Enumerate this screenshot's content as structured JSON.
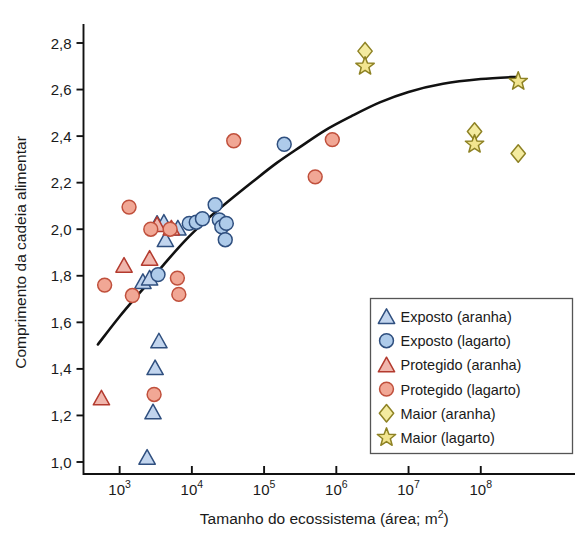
{
  "chart_data": {
    "type": "scatter",
    "title": "",
    "xlabel": "Tamanho do ecossistema (área; m2)",
    "xlabel_base": "Tamanho do ecossistema (área; m",
    "xlabel_sup": "2",
    "xlabel_tail": ")",
    "ylabel": "Comprimento da cadeia alimentar",
    "xscale": "log",
    "xlim": [
      316,
      1000000000
    ],
    "ylim": [
      0.93,
      2.92
    ],
    "grid": false,
    "legend_position": "bottom-right",
    "xticks": [
      {
        "value": 1000,
        "mantissa": "10",
        "exponent": "3"
      },
      {
        "value": 10000,
        "mantissa": "10",
        "exponent": "4"
      },
      {
        "value": 100000,
        "mantissa": "10",
        "exponent": "5"
      },
      {
        "value": 1000000,
        "mantissa": "10",
        "exponent": "6"
      },
      {
        "value": 10000000,
        "mantissa": "10",
        "exponent": "7"
      },
      {
        "value": 100000000,
        "mantissa": "10",
        "exponent": "8"
      }
    ],
    "yticks": [
      {
        "value": 1.0,
        "label": "1,0"
      },
      {
        "value": 1.2,
        "label": "1,2"
      },
      {
        "value": 1.4,
        "label": "1,4"
      },
      {
        "value": 1.6,
        "label": "1,6"
      },
      {
        "value": 1.8,
        "label": "1,8"
      },
      {
        "value": 2.0,
        "label": "2,0"
      },
      {
        "value": 2.2,
        "label": "2,2"
      },
      {
        "value": 2.4,
        "label": "2,4"
      },
      {
        "value": 2.6,
        "label": "2,6"
      },
      {
        "value": 2.8,
        "label": "2,8"
      }
    ],
    "series": [
      {
        "name": "Exposto (aranha)",
        "marker": "triangle",
        "fill": "#c2d5ee",
        "stroke": "#2f4f7f",
        "points": [
          {
            "x": 2100,
            "y": 1.775
          },
          {
            "x": 2600,
            "y": 1.79
          },
          {
            "x": 3300,
            "y": 2.025
          },
          {
            "x": 4100,
            "y": 2.03
          },
          {
            "x": 4300,
            "y": 1.955
          },
          {
            "x": 6400,
            "y": 2.005
          },
          {
            "x": 2400,
            "y": 1.02
          },
          {
            "x": 2900,
            "y": 1.215
          },
          {
            "x": 3100,
            "y": 1.405
          },
          {
            "x": 3500,
            "y": 1.52
          }
        ]
      },
      {
        "name": "Exposto (lagarto)",
        "marker": "circle",
        "fill": "#aecbea",
        "stroke": "#2f4f7f",
        "points": [
          {
            "x": 3400,
            "y": 1.805
          },
          {
            "x": 9200,
            "y": 2.025
          },
          {
            "x": 11500,
            "y": 2.03
          },
          {
            "x": 14000,
            "y": 2.045
          },
          {
            "x": 21000,
            "y": 2.105
          },
          {
            "x": 24000,
            "y": 2.04
          },
          {
            "x": 26000,
            "y": 2.01
          },
          {
            "x": 30000,
            "y": 2.025
          },
          {
            "x": 29000,
            "y": 1.955
          },
          {
            "x": 190000,
            "y": 2.365
          }
        ]
      },
      {
        "name": "Protegido (aranha)",
        "marker": "triangle",
        "fill": "#f0b6ad",
        "stroke": "#b33a2e",
        "points": [
          {
            "x": 560,
            "y": 1.275
          },
          {
            "x": 1150,
            "y": 1.845
          },
          {
            "x": 2600,
            "y": 1.875
          },
          {
            "x": 3300,
            "y": 2.02
          },
          {
            "x": 5200,
            "y": 2.005
          }
        ]
      },
      {
        "name": "Protegido (lagarto)",
        "marker": "circle",
        "fill": "#f1a795",
        "stroke": "#c0503c",
        "points": [
          {
            "x": 620,
            "y": 1.76
          },
          {
            "x": 1350,
            "y": 2.095
          },
          {
            "x": 1500,
            "y": 1.715
          },
          {
            "x": 2700,
            "y": 2.0
          },
          {
            "x": 3000,
            "y": 1.29
          },
          {
            "x": 5000,
            "y": 2.0
          },
          {
            "x": 6300,
            "y": 1.79
          },
          {
            "x": 6600,
            "y": 1.72
          },
          {
            "x": 38000,
            "y": 2.38
          },
          {
            "x": 510000,
            "y": 2.225
          },
          {
            "x": 880000,
            "y": 2.385
          }
        ]
      },
      {
        "name": "Maior (aranha)",
        "marker": "diamond",
        "fill": "#f4eba0",
        "stroke": "#8e8224",
        "points": [
          {
            "x": 2500000,
            "y": 2.765
          },
          {
            "x": 82000000,
            "y": 2.42
          },
          {
            "x": 330000000,
            "y": 2.325
          }
        ]
      },
      {
        "name": "Maior (lagarto)",
        "marker": "star",
        "fill": "#f2e58f",
        "stroke": "#8e8224",
        "points": [
          {
            "x": 2500000,
            "y": 2.7
          },
          {
            "x": 82000000,
            "y": 2.365
          },
          {
            "x": 330000000,
            "y": 2.635
          }
        ]
      }
    ],
    "trend_curve": {
      "name": "fitted-trend-line",
      "color": "#111111",
      "width": 2.6,
      "points": [
        {
          "x": 500,
          "y": 1.505
        },
        {
          "x": 1000,
          "y": 1.625
        },
        {
          "x": 2000,
          "y": 1.735
        },
        {
          "x": 4000,
          "y": 1.845
        },
        {
          "x": 8000,
          "y": 1.95
        },
        {
          "x": 16000,
          "y": 2.04
        },
        {
          "x": 32000,
          "y": 2.12
        },
        {
          "x": 70000,
          "y": 2.205
        },
        {
          "x": 150000,
          "y": 2.285
        },
        {
          "x": 320000,
          "y": 2.355
        },
        {
          "x": 700000,
          "y": 2.425
        },
        {
          "x": 1600000,
          "y": 2.485
        },
        {
          "x": 4000000,
          "y": 2.545
        },
        {
          "x": 10000000,
          "y": 2.59
        },
        {
          "x": 30000000,
          "y": 2.625
        },
        {
          "x": 100000000,
          "y": 2.645
        },
        {
          "x": 330000000,
          "y": 2.655
        }
      ]
    },
    "legend_entries": [
      {
        "label": "Exposto (aranha)",
        "marker": "triangle",
        "fill": "#c2d5ee",
        "stroke": "#2f4f7f"
      },
      {
        "label": "Exposto (lagarto)",
        "marker": "circle",
        "fill": "#aecbea",
        "stroke": "#2f4f7f"
      },
      {
        "label": "Protegido (aranha)",
        "marker": "triangle",
        "fill": "#f0b6ad",
        "stroke": "#b33a2e"
      },
      {
        "label": "Protegido (lagarto)",
        "marker": "circle",
        "fill": "#f1a795",
        "stroke": "#c0503c"
      },
      {
        "label": "Maior (aranha)",
        "marker": "diamond",
        "fill": "#f4eba0",
        "stroke": "#8e8224"
      },
      {
        "label": "Maior (lagarto)",
        "marker": "star",
        "fill": "#f2e58f",
        "stroke": "#8e8224"
      }
    ]
  }
}
